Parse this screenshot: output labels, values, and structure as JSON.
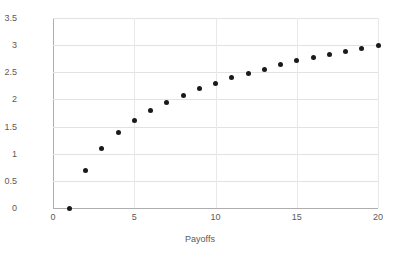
{
  "chart_data": {
    "type": "scatter",
    "title": "",
    "xlabel": "Payoffs",
    "ylabel": "Utility",
    "xlim": [
      0,
      20
    ],
    "ylim": [
      0,
      3.5
    ],
    "xticks": [
      "0",
      "5",
      "10",
      "15",
      "20"
    ],
    "xtick_values": [
      0,
      5,
      10,
      15,
      20
    ],
    "yticks": [
      "0",
      "0.5",
      "1",
      "1.5",
      "2",
      "2.5",
      "3",
      "3.5"
    ],
    "ytick_values": [
      0,
      0.5,
      1,
      1.5,
      2,
      2.5,
      3,
      3.5
    ],
    "grid": "horizontal",
    "legend": "none",
    "marker_color": "#1a1a1a",
    "grid_color": "#e2e2e2",
    "axis_color": "#aeaeae",
    "background_color": "#ffffff",
    "series": [
      {
        "name": "Utility",
        "x": [
          1,
          2,
          3,
          4,
          5,
          6,
          7,
          8,
          9,
          10,
          11,
          12,
          13,
          14,
          15,
          16,
          17,
          18,
          19,
          20
        ],
        "values": [
          0,
          0.69,
          1.1,
          1.39,
          1.61,
          1.79,
          1.95,
          2.08,
          2.2,
          2.3,
          2.4,
          2.48,
          2.56,
          2.64,
          2.71,
          2.77,
          2.83,
          2.89,
          2.94,
          3.0
        ]
      }
    ]
  }
}
